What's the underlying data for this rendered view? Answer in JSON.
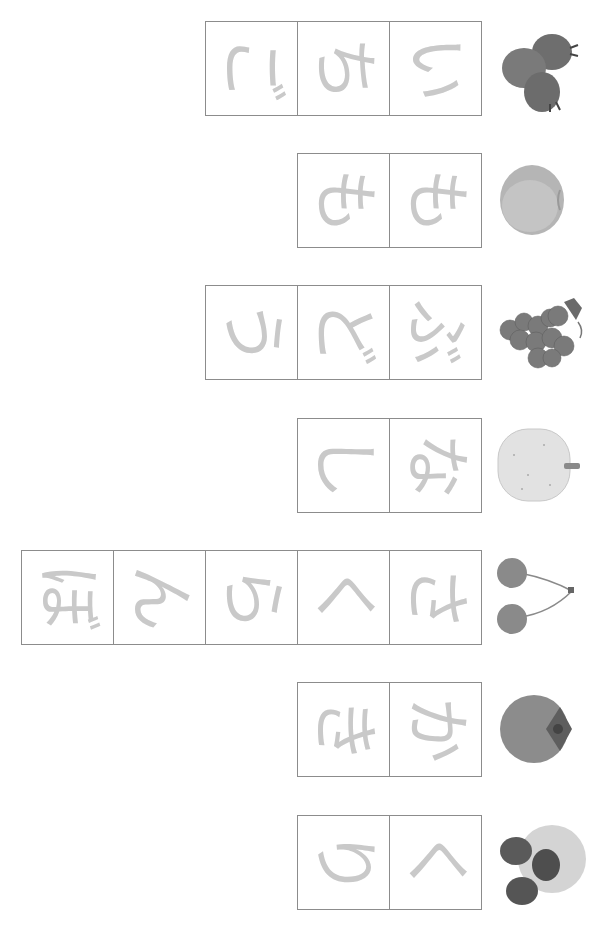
{
  "worksheet": {
    "orientation": "rotated-90-clockwise",
    "rows": [
      {
        "word": "いちご",
        "meaning_picture": "strawberry",
        "chars": [
          "い",
          "ち",
          "ご"
        ]
      },
      {
        "word": "もも",
        "meaning_picture": "peach",
        "chars": [
          "も",
          "も"
        ]
      },
      {
        "word": "ぶどう",
        "meaning_picture": "grapes",
        "chars": [
          "ぶ",
          "ど",
          "う"
        ]
      },
      {
        "word": "なし",
        "meaning_picture": "pear",
        "chars": [
          "な",
          "し"
        ]
      },
      {
        "word": "さくらんぼ",
        "meaning_picture": "cherries",
        "chars": [
          "さ",
          "く",
          "ら",
          "ん",
          "ぼ"
        ]
      },
      {
        "word": "かき",
        "meaning_picture": "persimmon",
        "chars": [
          "か",
          "き"
        ]
      },
      {
        "word": "くり",
        "meaning_picture": "chestnut",
        "chars": [
          "く",
          "り"
        ]
      }
    ]
  },
  "colors": {
    "box_border": "#8c8c8c",
    "trace_glyph": "#c9c9c9",
    "background": "#ffffff"
  }
}
